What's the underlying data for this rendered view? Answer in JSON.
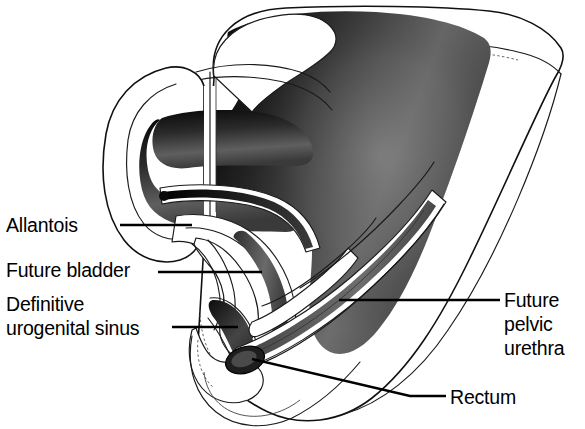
{
  "figure": {
    "background_color": "#ffffff",
    "ink_color": "#000000",
    "view": "sagittal cut-away of embryonic caudal body region",
    "width": 585,
    "height": 429
  },
  "labels": [
    {
      "id": "allantois",
      "name": "allantois-label",
      "lines": [
        "Allantois"
      ],
      "text_anchor": "start",
      "text_x": 6,
      "text_y": 232,
      "leader": "M 120 225 L 192 225",
      "align": "left"
    },
    {
      "id": "future-bladder",
      "name": "future-bladder-label",
      "lines": [
        "Future bladder"
      ],
      "text_anchor": "start",
      "text_x": 6,
      "text_y": 277,
      "leader": "M 158 272 L 262 272",
      "align": "left"
    },
    {
      "id": "definitive-urogenital-sinus",
      "name": "definitive-urogenital-sinus-label",
      "lines": [
        "Definitive",
        "urogenital sinus"
      ],
      "text_anchor": "start",
      "text_x": 6,
      "text_y": 311,
      "leader": "M 172 327 L 238 327",
      "align": "left"
    },
    {
      "id": "future-pelvic-urethra",
      "name": "future-pelvic-urethra-label",
      "lines": [
        "Future",
        "pelvic",
        "urethra"
      ],
      "text_anchor": "start",
      "text_x": 504,
      "text_y": 307,
      "leader": "M 339 300 L 500 300",
      "align": "right"
    },
    {
      "id": "rectum",
      "name": "rectum-label",
      "lines": [
        "Rectum"
      ],
      "text_anchor": "start",
      "text_x": 450,
      "text_y": 404,
      "leader": "M 252 359 L 410 396 L 446 396",
      "align": "right"
    }
  ],
  "structures": [
    {
      "id": "body-wall",
      "name": "embryo-body-wall-outline",
      "description": "outer contour of the caudal embryo with cut surface at right"
    },
    {
      "id": "mesenchyme-mass",
      "name": "mesenchyme-shaded-mass",
      "description": "airbrush shaded grey mass of body mesenchyme",
      "shading": "gradient dark to mid grey"
    },
    {
      "id": "allantois-tube",
      "name": "allantois-tube",
      "description": "thin dark tube extending anteriorly from the bladder apex"
    },
    {
      "id": "bladder-lumen",
      "name": "future-bladder-lumen",
      "description": "expanded lumen continuous with the allantois"
    },
    {
      "id": "urogenital-sinus-lumen",
      "name": "definitive-urogenital-sinus-lumen",
      "description": "ventral dark lumen below the bladder"
    },
    {
      "id": "pelvic-urethra-lumen",
      "name": "future-pelvic-urethra-lumen",
      "description": "narrow channel between bladder and urogenital sinus"
    },
    {
      "id": "rectum-lumen",
      "name": "rectum-lumen",
      "description": "dorsal tube running postero-superiorly, shaded grey"
    },
    {
      "id": "urorectal-septum",
      "name": "urorectal-septum",
      "description": "wedge of mesenchyme separating urogenital sinus from rectum"
    },
    {
      "id": "tail-gut",
      "name": "tail-gut-region",
      "description": "caudal oval terminus of the cloacal region"
    }
  ]
}
